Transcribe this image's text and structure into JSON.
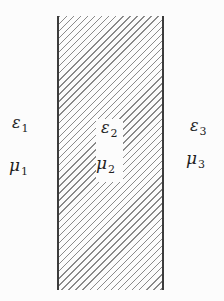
{
  "labels": {
    "region1": {
      "epsilon": "ε",
      "epsilon_sub": "1",
      "mu": "μ",
      "mu_sub": "1"
    },
    "region2": {
      "epsilon": "ε",
      "epsilon_sub": "2",
      "mu": "μ",
      "mu_sub": "2"
    },
    "region3": {
      "epsilon": "ε",
      "epsilon_sub": "3",
      "mu": "μ",
      "mu_sub": "3"
    }
  },
  "colors": {
    "background": "#fcfcfc",
    "hatch_line": "#8a8a8a",
    "slab_border": "#3c3c3c",
    "label_text": "#1f1f1f"
  }
}
